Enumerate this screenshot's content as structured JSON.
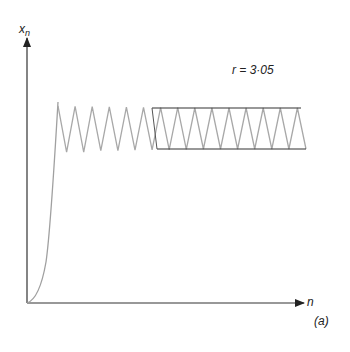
{
  "chart_data": {
    "type": "line",
    "title": "",
    "annotation": "r = 3·05",
    "panel_label": "(a)",
    "xlabel": "n",
    "ylabel": "x_n",
    "ylabel_main": "x",
    "ylabel_sub": "n",
    "grid": false,
    "legend": null,
    "r": 3.05,
    "series": [
      {
        "name": "x_n",
        "color": "#9a9a9a",
        "x": [
          0,
          1,
          2,
          3,
          4,
          5,
          6,
          7,
          8,
          9,
          10,
          11,
          12,
          13,
          14,
          15,
          16,
          17,
          18,
          19,
          20,
          21,
          22,
          23,
          24,
          25,
          26,
          27,
          28,
          29,
          30,
          31,
          32,
          33,
          34
        ],
        "values": [
          0.0,
          0.02,
          0.06,
          0.17,
          0.43,
          0.745,
          0.58,
          0.743,
          0.58,
          0.742,
          0.585,
          0.741,
          0.585,
          0.74,
          0.587,
          0.739,
          0.588,
          0.738,
          0.589,
          0.738,
          0.59,
          0.737,
          0.591,
          0.737,
          0.591,
          0.737,
          0.591,
          0.737,
          0.591,
          0.737,
          0.591,
          0.737,
          0.591,
          0.737,
          0.591
        ]
      }
    ],
    "cycle_bounds": {
      "upper": 0.737,
      "lower": 0.591,
      "color": "#333333"
    }
  },
  "labels": {
    "ylabel_main": "x",
    "ylabel_sub": "n",
    "xlabel": "n",
    "annotation": "r = 3·05",
    "panel": "(a)"
  }
}
